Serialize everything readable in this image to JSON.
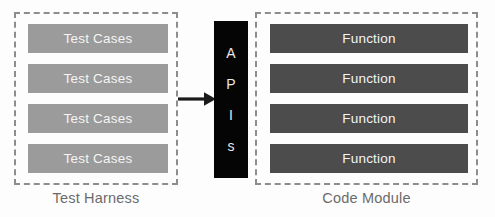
{
  "diagram": {
    "title_visible": false,
    "background_color": "#fdfdfd",
    "groups": [
      {
        "id": "test-harness",
        "caption": "Test Harness",
        "border_color": "#8d8d8d",
        "items": [
          {
            "label": "Test Cases"
          },
          {
            "label": "Test Cases"
          },
          {
            "label": "Test Cases"
          },
          {
            "label": "Test Cases"
          }
        ],
        "item_color": "#9b9b9b",
        "item_text_color": "#f4f4f4"
      },
      {
        "id": "code-module",
        "caption": "Code Module",
        "border_color": "#8d8d8d",
        "items": [
          {
            "label": "Function"
          },
          {
            "label": "Function"
          },
          {
            "label": "Function"
          },
          {
            "label": "Function"
          }
        ],
        "item_color": "#4c4c4c",
        "item_text_color": "#f4f4f4"
      }
    ],
    "connector": {
      "label": "APIs",
      "letters": [
        "A",
        "P",
        "I",
        "s"
      ],
      "background_color": "#050505",
      "text_color": "#e8e8e8"
    },
    "arrow": {
      "direction": "right",
      "from": "test-harness",
      "to": "apis",
      "color": "#1a1a1a"
    },
    "caption_color": "#6b6b6b"
  }
}
